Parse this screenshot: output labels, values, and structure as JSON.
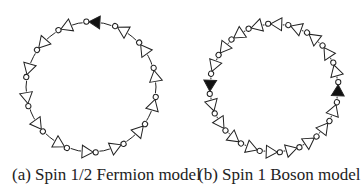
{
  "figure": {
    "panels": [
      {
        "id": "a",
        "caption": "(a) Spin 1/2 Fermion model",
        "ring": {
          "cx": 91,
          "cy": 87,
          "r": 65,
          "count": 14,
          "start_angle_deg": -87,
          "direction": "counter-clockwise",
          "filled_indices": [
            0
          ]
        }
      },
      {
        "id": "b",
        "caption": "(b) Spin 1 Boson model",
        "ring": {
          "cx": 274,
          "cy": 88,
          "r": 64,
          "count": 20,
          "start_angle_deg": -88,
          "direction": "counter-clockwise",
          "filled_indices": [
            5,
            15
          ]
        }
      }
    ],
    "colors": {
      "stroke": "#222222",
      "filled": "#111111",
      "hollow": "#ffffff"
    },
    "element": {
      "type": "inverter-triangle-with-bubble",
      "triangle_size": 11,
      "bubble_radius": 2.6
    }
  }
}
